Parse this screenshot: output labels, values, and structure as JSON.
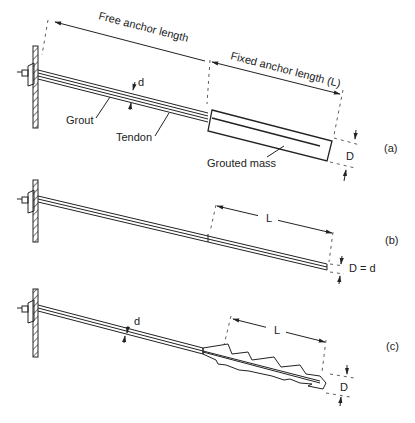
{
  "figure": {
    "panels": [
      {
        "id": "a",
        "tag": "(a)",
        "labels": {
          "free_length": "Free anchor length",
          "fixed_length": "Fixed anchor length (L)",
          "grout": "Grout",
          "tendon": "Tendon",
          "grouted_mass": "Grouted mass",
          "d": "d",
          "D": "D"
        }
      },
      {
        "id": "b",
        "tag": "(b)",
        "labels": {
          "L": "L",
          "D_eq_d": "D = d"
        }
      },
      {
        "id": "c",
        "tag": "(c)",
        "labels": {
          "d": "d",
          "L": "L",
          "D": "D"
        }
      }
    ]
  }
}
